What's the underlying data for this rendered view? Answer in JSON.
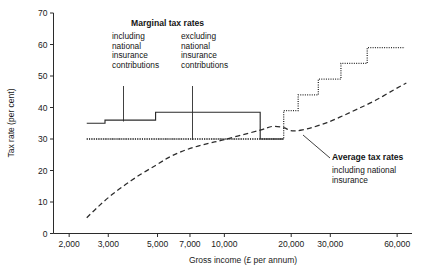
{
  "chart_data": {
    "type": "line",
    "title": "",
    "xlabel": "Gross income (£ per annum)",
    "ylabel": "Tax rate (per cent)",
    "xscale": "log",
    "xlim": [
      1700,
      70000
    ],
    "ylim": [
      0,
      70
    ],
    "xticks": [
      2000,
      3000,
      5000,
      7000,
      10000,
      20000,
      30000,
      60000
    ],
    "xticklabels": [
      "2,000",
      "3,000",
      "5,000",
      "7,000",
      "10,000",
      "20,000",
      "30,000",
      "60,000"
    ],
    "yticks": [
      0,
      10,
      20,
      30,
      40,
      50,
      60,
      70
    ],
    "yticklabels": [
      "0",
      "10",
      "20",
      "30",
      "40",
      "50",
      "60",
      "70"
    ],
    "grid": false,
    "legend_position": "annotations-inline",
    "reference_line": {
      "name": "basic-rate-30-percent",
      "y": 30,
      "x_from": 2400,
      "x_to": 18500,
      "style": "dotted"
    },
    "series": [
      {
        "name": "Marginal tax rates including national insurance contributions",
        "style": "solid-step",
        "x": [
          2400,
          2900,
          2900,
          4900,
          4900,
          14500,
          14500,
          18500,
          18500
        ],
        "y": [
          35,
          35,
          36,
          36,
          38.5,
          38.5,
          30,
          30,
          30
        ]
      },
      {
        "name": "Marginal tax rates excluding national insurance contributions",
        "style": "dotted-step",
        "x": [
          2400,
          18500,
          18500,
          21500,
          21500,
          26500,
          26500,
          33500,
          33500,
          44000,
          44000,
          65000
        ],
        "y": [
          30,
          30,
          39,
          39,
          44,
          44,
          49,
          49,
          54,
          54,
          59,
          59
        ]
      },
      {
        "name": "Average tax rates including national insurance",
        "style": "dashed-curve",
        "x": [
          2400,
          2700,
          3100,
          3600,
          4200,
          4900,
          5600,
          6400,
          7400,
          8600,
          10000,
          12000,
          14500,
          16500,
          18500,
          19600,
          20800,
          22500,
          25000,
          29000,
          34000,
          40000,
          48000,
          58000,
          66000
        ],
        "y": [
          5,
          8.5,
          12.2,
          15.6,
          18.8,
          21.6,
          24.1,
          26.0,
          27.5,
          28.7,
          29.8,
          31.3,
          32.8,
          34.0,
          33.6,
          32.8,
          32.6,
          32.9,
          33.7,
          35.2,
          37.3,
          39.6,
          42.3,
          45.6,
          47.8
        ]
      }
    ]
  },
  "annotations": {
    "marginal_title": "Marginal tax rates",
    "including_block": "including\nnational\ninsurance\ncontributions",
    "excluding_block": "excluding\nnational\ninsurance\ncontributions",
    "average_title": "Average tax rates",
    "average_sub": "including national\ninsurance"
  },
  "colors": {
    "ink": "#2b2b2b",
    "background": "#ffffff"
  }
}
